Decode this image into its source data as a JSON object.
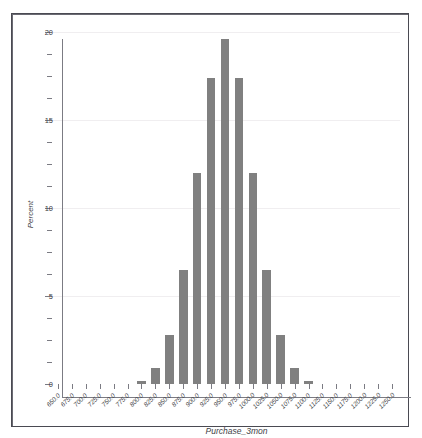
{
  "chart_data": {
    "type": "bar",
    "title": "",
    "subtitle": "",
    "xlabel": "Purchase_3mon",
    "ylabel": "Percent",
    "grid": true,
    "legend": null,
    "xlim": [
      650.0,
      1250.0
    ],
    "ylim": [
      0,
      20
    ],
    "x_tick_labels": [
      "650.0",
      "675.0",
      "700.0",
      "725.0",
      "750.0",
      "775.0",
      "800.0",
      "825.0",
      "850.0",
      "875.0",
      "900.0",
      "925.0",
      "950.0",
      "975.0",
      "1000.0",
      "1025.0",
      "1050.0",
      "1075.0",
      "1100.0",
      "1125.0",
      "1150.0",
      "1175.0",
      "1200.0",
      "1225.0",
      "1250.0"
    ],
    "y_tick_labels": [
      "0",
      "5",
      "10",
      "15",
      "20"
    ],
    "y_ticks": [
      0,
      5,
      10,
      15,
      20
    ],
    "y_minor_tick_step": 1.25,
    "bar_color": "#808080",
    "background_color": "#ffffff",
    "axis_color": "#7b7b83",
    "categories": [
      650.0,
      675.0,
      700.0,
      725.0,
      750.0,
      775.0,
      800.0,
      825.0,
      850.0,
      875.0,
      900.0,
      925.0,
      950.0,
      975.0,
      1000.0,
      1025.0,
      1050.0,
      1075.0,
      1100.0,
      1125.0,
      1150.0,
      1175.0,
      1200.0,
      1225.0,
      1250.0
    ],
    "values": [
      0,
      0,
      0,
      0,
      0,
      0,
      0.15,
      0.9,
      2.8,
      6.5,
      12.0,
      17.4,
      19.6,
      17.4,
      12.0,
      6.5,
      2.8,
      0.9,
      0.15,
      0,
      0,
      0,
      0,
      0,
      0
    ]
  },
  "axis_titles": {
    "y": "Percent",
    "x": "Purchase_3mon"
  }
}
